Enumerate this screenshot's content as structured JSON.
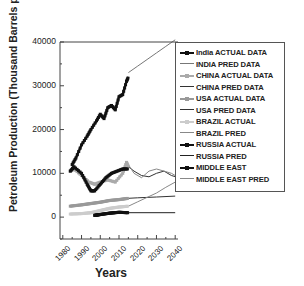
{
  "chart_data": {
    "type": "line",
    "title": "",
    "xlabel": "Years",
    "ylabel": "Petroleum Production (Thousand Barrels per day)",
    "xlim": [
      1980,
      2042
    ],
    "ylim": [
      -5000,
      40000
    ],
    "x_ticks": [
      "1980",
      "1990",
      "2000",
      "2010",
      "2020",
      "2030",
      "2040"
    ],
    "y_ticks": [
      "0",
      "10000",
      "20000",
      "30000",
      "40000"
    ],
    "grid": false,
    "legend_position": "upper right (overlapping plot)",
    "series": [
      {
        "name": "India ACTUAL DATA",
        "style": "black line with square markers",
        "x": [
          1985,
          1987,
          1990,
          1993,
          1995,
          1998,
          2000,
          2002,
          2004,
          2006,
          2008,
          2010,
          2012,
          2014,
          2015
        ],
        "y": [
          12000,
          13500,
          16500,
          18500,
          20000,
          22000,
          23500,
          22500,
          25000,
          25500,
          24500,
          27500,
          28000,
          31000,
          32000
        ]
      },
      {
        "name": "INDIA PRED DATA",
        "style": "gray line",
        "x": [
          2015,
          2020,
          2025,
          2030,
          2035,
          2040
        ],
        "y": [
          33000,
          34500,
          36000,
          37500,
          39000,
          40500
        ]
      },
      {
        "name": "CHINA ACTUAL DATA",
        "style": "light gray line with markers",
        "x": [
          1984,
          1986,
          1990,
          1994,
          1997,
          2000,
          2004,
          2008,
          2012,
          2014,
          2015
        ],
        "y": [
          10500,
          11000,
          9500,
          8000,
          7500,
          8000,
          8500,
          8000,
          10000,
          12500,
          11500
        ]
      },
      {
        "name": "CHINA PRED DATA",
        "style": "dark line",
        "x": [
          2015,
          2018,
          2022,
          2026,
          2030,
          2034,
          2038,
          2042
        ],
        "y": [
          11500,
          10500,
          9500,
          9200,
          10000,
          10500,
          9500,
          9000
        ]
      },
      {
        "name": "USA ACTUAL DATA",
        "style": "gray line with markers",
        "x": [
          1984,
          1990,
          1995,
          2000,
          2005,
          2010,
          2015
        ],
        "y": [
          2500,
          2800,
          3100,
          3400,
          3800,
          4000,
          4300
        ]
      },
      {
        "name": "USA PRED DATA",
        "style": "dark line",
        "x": [
          2015,
          2020,
          2030,
          2040
        ],
        "y": [
          4300,
          4400,
          4600,
          4800
        ]
      },
      {
        "name": "BRAZIL ACTUAL",
        "style": "light gray line with markers",
        "x": [
          1984,
          1990,
          1995,
          2000,
          2005,
          2010,
          2015
        ],
        "y": [
          700,
          800,
          1000,
          1500,
          2000,
          2300,
          2500
        ]
      },
      {
        "name": "BRAZIL PRED",
        "style": "gray line",
        "x": [
          2015,
          2020,
          2025,
          2030,
          2035,
          2040
        ],
        "y": [
          2500,
          3500,
          4500,
          5500,
          6800,
          8000
        ]
      },
      {
        "name": "RUSSIA ACTUAL",
        "style": "black line with markers",
        "x": [
          1997,
          2000,
          2005,
          2010,
          2015
        ],
        "y": [
          400,
          600,
          900,
          1100,
          1000
        ]
      },
      {
        "name": "RUSSIA PRED",
        "style": "dark line",
        "x": [
          2015,
          2040
        ],
        "y": [
          1000,
          1000
        ]
      },
      {
        "name": "MIDDLE EAST",
        "style": "black thick line with square markers",
        "x": [
          1984,
          1986,
          1990,
          1993,
          1995,
          1997,
          2000,
          2003,
          2006,
          2009,
          2012,
          2015
        ],
        "y": [
          10500,
          11500,
          10000,
          7500,
          6000,
          6000,
          7500,
          9000,
          10000,
          10500,
          11000,
          11000
        ]
      },
      {
        "name": "MIDDLE EAST PRED",
        "style": "thin gray line",
        "x": [
          2015,
          2018,
          2022,
          2026,
          2030,
          2034,
          2038,
          2042
        ],
        "y": [
          12000,
          10000,
          9000,
          10500,
          11000,
          10500,
          10000,
          9000
        ]
      }
    ]
  },
  "axes": {
    "xlabel": "Years",
    "ylabel": "Petroleum Production (Thousand Barrels per day)"
  },
  "legend": {
    "items": [
      {
        "label": "India ACTUAL DATA",
        "color": "#111111",
        "marker": true,
        "width": 2
      },
      {
        "label": "INDIA PRED DATA",
        "color": "#777777",
        "marker": false,
        "width": 1
      },
      {
        "label": "CHINA ACTUAL DATA",
        "color": "#aaaaaa",
        "marker": true,
        "width": 2
      },
      {
        "label": "CHINA PRED DATA",
        "color": "#333333",
        "marker": false,
        "width": 1
      },
      {
        "label": "USA ACTUAL DATA",
        "color": "#999999",
        "marker": true,
        "width": 2
      },
      {
        "label": "USA PRED DATA",
        "color": "#333333",
        "marker": false,
        "width": 1
      },
      {
        "label": "BRAZIL ACTUAL",
        "color": "#cccccc",
        "marker": true,
        "width": 2
      },
      {
        "label": "BRAZIL PRED",
        "color": "#888888",
        "marker": false,
        "width": 1
      },
      {
        "label": "RUSSIA ACTUAL",
        "color": "#111111",
        "marker": true,
        "width": 2
      },
      {
        "label": "RUSSIA PRED",
        "color": "#222222",
        "marker": false,
        "width": 1
      },
      {
        "label": "MIDDLE EAST",
        "color": "#111111",
        "marker": true,
        "width": 2
      },
      {
        "label": "MIDDLE EAST PRED",
        "color": "#888888",
        "marker": false,
        "width": 1
      }
    ]
  }
}
